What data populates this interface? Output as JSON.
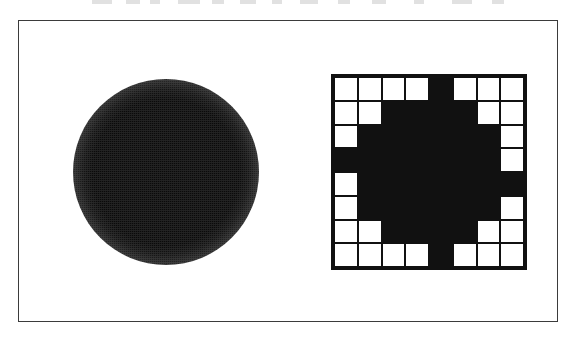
{
  "figure": {
    "background_color": "#ffffff",
    "frame": {
      "label": "figure-border",
      "stroke_color": "#3b3b3b",
      "stroke_width": 1.4
    },
    "panels": [
      {
        "id": "continuous-disk",
        "label": "blurred disk",
        "shape": "circle",
        "fill_color": "#0a0a0a",
        "edge": "soft gradient falloff",
        "diameter_px": 186
      },
      {
        "id": "quantized-disk",
        "label": "pixelated disk",
        "shape": "grid",
        "fill_color": "#111111",
        "empty_color": "#ffffff",
        "grid_line_color": "#111111",
        "border_width": 3.5
      }
    ]
  },
  "chart_data": {
    "type": "heatmap",
    "title": "",
    "subtitle": "",
    "xlabel": "",
    "ylabel": "",
    "rows": 8,
    "cols": 8,
    "legend": [],
    "grid": true,
    "value_labels": {
      "0": "white / background",
      "1": "black / filled"
    },
    "colormap": {
      "0": "#ffffff",
      "1": "#111111"
    },
    "values": [
      [
        0,
        0,
        0,
        0,
        1,
        0,
        0,
        0
      ],
      [
        0,
        0,
        1,
        1,
        1,
        1,
        0,
        0
      ],
      [
        0,
        1,
        1,
        1,
        1,
        1,
        1,
        0
      ],
      [
        1,
        1,
        1,
        1,
        1,
        1,
        1,
        0
      ],
      [
        0,
        1,
        1,
        1,
        1,
        1,
        1,
        1
      ],
      [
        0,
        1,
        1,
        1,
        1,
        1,
        1,
        0
      ],
      [
        0,
        0,
        1,
        1,
        1,
        1,
        0,
        0
      ],
      [
        0,
        0,
        0,
        0,
        1,
        0,
        0,
        0
      ]
    ]
  },
  "scan_artifacts": {
    "top_bleed": [
      {
        "x": 92,
        "w": 20
      },
      {
        "x": 126,
        "w": 14
      },
      {
        "x": 150,
        "w": 10
      },
      {
        "x": 178,
        "w": 22
      },
      {
        "x": 212,
        "w": 12
      },
      {
        "x": 240,
        "w": 16
      },
      {
        "x": 272,
        "w": 10
      },
      {
        "x": 300,
        "w": 18
      },
      {
        "x": 338,
        "w": 12
      },
      {
        "x": 372,
        "w": 14
      },
      {
        "x": 414,
        "w": 10
      },
      {
        "x": 452,
        "w": 20
      },
      {
        "x": 492,
        "w": 12
      }
    ]
  }
}
